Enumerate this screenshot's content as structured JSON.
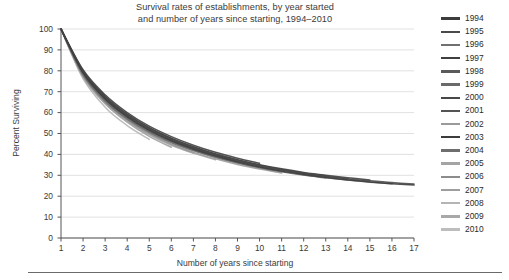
{
  "chart_data": {
    "type": "line",
    "title": "Survival rates of establishments, by year started and number of years since starting, 1994–2010",
    "title_lines": [
      "Survival rates of establishments, by year started",
      "and number of years since starting, 1994–2010"
    ],
    "xlabel": "Number of years since starting",
    "ylabel": "Percent Surviving",
    "xlim": [
      1,
      17
    ],
    "ylim": [
      0,
      100
    ],
    "grid": true,
    "grid_axis": "y",
    "legend_position": "right",
    "x": [
      1,
      2,
      3,
      4,
      5,
      6,
      7,
      8,
      9,
      10,
      11,
      12,
      13,
      14,
      15,
      16,
      17
    ],
    "xticks": [
      "1",
      "2",
      "3",
      "4",
      "5",
      "6",
      "7",
      "8",
      "9",
      "10",
      "11",
      "12",
      "13",
      "14",
      "15",
      "16",
      "17"
    ],
    "yticks": [
      "0",
      "10",
      "20",
      "30",
      "40",
      "50",
      "60",
      "70",
      "80",
      "90",
      "100"
    ],
    "ytick_values": [
      0,
      10,
      20,
      30,
      40,
      50,
      60,
      70,
      80,
      90,
      100
    ],
    "series": [
      {
        "name": "1994",
        "color": "#3c3c3c",
        "values": [
          100,
          79.0,
          66.5,
          58.0,
          51.5,
          46.5,
          42.5,
          39.2,
          36.4,
          34.0,
          32.0,
          30.4,
          29.0,
          27.8,
          26.8,
          26.0,
          25.3
        ]
      },
      {
        "name": "1995",
        "color": "#4a4a4a",
        "values": [
          100,
          79.5,
          67.2,
          58.8,
          52.3,
          47.3,
          43.2,
          39.9,
          37.1,
          34.7,
          32.7,
          31.0,
          29.6,
          28.4,
          27.4,
          26.5,
          25.8
        ]
      },
      {
        "name": "1996",
        "color": "#707070",
        "values": [
          100,
          78.4,
          65.8,
          57.2,
          50.8,
          45.9,
          42.0,
          38.8,
          36.1,
          33.8,
          31.9,
          30.3,
          28.9,
          27.7,
          26.7,
          25.9,
          null
        ]
      },
      {
        "name": "1997",
        "color": "#3f3f3f",
        "values": [
          100,
          80.0,
          67.8,
          59.3,
          52.8,
          47.8,
          43.7,
          40.3,
          37.5,
          35.1,
          33.1,
          31.4,
          30.0,
          28.8,
          27.8,
          null,
          null
        ]
      },
      {
        "name": "1998",
        "color": "#5a5a5a",
        "values": [
          100,
          79.2,
          66.8,
          58.3,
          51.9,
          47.0,
          43.0,
          39.7,
          36.9,
          34.6,
          32.6,
          30.9,
          29.5,
          28.3,
          null,
          null,
          null
        ]
      },
      {
        "name": "1999",
        "color": "#6a6a6a",
        "values": [
          100,
          78.0,
          65.5,
          57.0,
          50.6,
          45.7,
          41.8,
          38.6,
          35.9,
          33.6,
          31.7,
          30.1,
          28.7,
          null,
          null,
          null,
          null
        ]
      },
      {
        "name": "2000",
        "color": "#484848",
        "values": [
          100,
          79.8,
          67.5,
          59.0,
          52.5,
          47.5,
          43.4,
          40.0,
          37.2,
          34.8,
          32.8,
          31.1,
          29.7,
          null,
          null,
          null,
          null
        ]
      },
      {
        "name": "2001",
        "color": "#545454",
        "values": [
          100,
          79.4,
          67.0,
          58.5,
          52.0,
          47.0,
          43.0,
          39.7,
          36.9,
          34.5,
          32.5,
          30.8,
          null,
          null,
          null,
          null,
          null
        ]
      },
      {
        "name": "2002",
        "color": "#9a9a9a",
        "values": [
          100,
          77.5,
          64.8,
          56.3,
          49.9,
          45.0,
          41.1,
          37.9,
          35.2,
          33.0,
          31.1,
          null,
          null,
          null,
          null,
          null,
          null
        ]
      },
      {
        "name": "2003",
        "color": "#3c3c3c",
        "values": [
          100,
          80.5,
          68.5,
          60.0,
          53.5,
          48.5,
          44.4,
          41.0,
          38.2,
          35.8,
          null,
          null,
          null,
          null,
          null,
          null,
          null
        ]
      },
      {
        "name": "2004",
        "color": "#6e6e6e",
        "values": [
          100,
          78.8,
          66.2,
          57.7,
          51.3,
          46.4,
          42.5,
          39.3,
          36.6,
          null,
          null,
          null,
          null,
          null,
          null,
          null,
          null
        ]
      },
      {
        "name": "2005",
        "color": "#a4a4a4",
        "values": [
          100,
          77.0,
          64.2,
          55.7,
          49.3,
          44.4,
          40.6,
          37.4,
          null,
          null,
          null,
          null,
          null,
          null,
          null,
          null,
          null
        ]
      },
      {
        "name": "2006",
        "color": "#8c8c8c",
        "values": [
          100,
          78.2,
          65.2,
          56.4,
          49.8,
          44.7,
          40.7,
          null,
          null,
          null,
          null,
          null,
          null,
          null,
          null,
          null,
          null
        ]
      },
      {
        "name": "2007",
        "color": "#9e9e9e",
        "values": [
          100,
          77.8,
          64.4,
          55.4,
          48.6,
          43.4,
          null,
          null,
          null,
          null,
          null,
          null,
          null,
          null,
          null,
          null,
          null
        ]
      },
      {
        "name": "2008",
        "color": "#b4b4b4",
        "values": [
          100,
          76.2,
          62.6,
          53.8,
          47.2,
          null,
          null,
          null,
          null,
          null,
          null,
          null,
          null,
          null,
          null,
          null,
          null
        ]
      },
      {
        "name": "2009",
        "color": "#a8a8a8",
        "values": [
          100,
          78.5,
          66.0,
          57.5,
          null,
          null,
          null,
          null,
          null,
          null,
          null,
          null,
          null,
          null,
          null,
          null,
          null
        ]
      },
      {
        "name": "2010",
        "color": "#bdbdbd",
        "values": [
          100,
          79.0,
          67.0,
          null,
          null,
          null,
          null,
          null,
          null,
          null,
          null,
          null,
          null,
          null,
          null,
          null,
          null
        ]
      }
    ]
  },
  "legend": {
    "items": [
      {
        "label": "1994"
      },
      {
        "label": "1995"
      },
      {
        "label": "1996"
      },
      {
        "label": "1997"
      },
      {
        "label": "1998"
      },
      {
        "label": "1999"
      },
      {
        "label": "2000"
      },
      {
        "label": "2001"
      },
      {
        "label": "2002"
      },
      {
        "label": "2003"
      },
      {
        "label": "2004"
      },
      {
        "label": "2005"
      },
      {
        "label": "2006"
      },
      {
        "label": "2007"
      },
      {
        "label": "2008"
      },
      {
        "label": "2009"
      },
      {
        "label": "2010"
      }
    ]
  },
  "style": {
    "grid_color": "#d9d9d9",
    "axis_color": "#555555",
    "text_color": "#3a3a3a",
    "background": "#ffffff",
    "rule_color": "#6a6a6a"
  }
}
